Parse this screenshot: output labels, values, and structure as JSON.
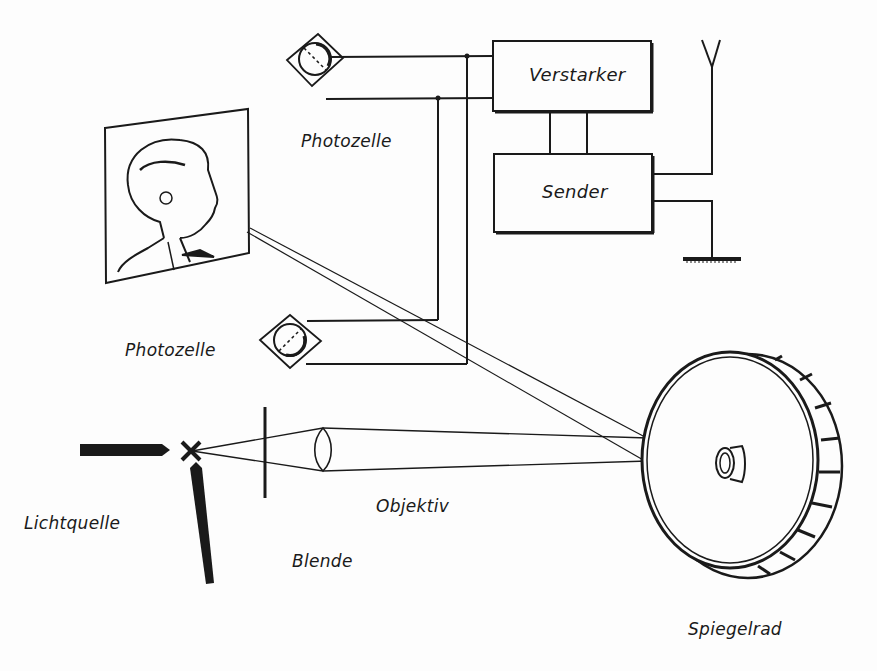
{
  "labels": {
    "amplifier": "Verstarker",
    "transmitter": "Sender",
    "photocell_top": "Photozelle",
    "photocell_bottom": "Photozelle",
    "light_source": "Lichtquelle",
    "objective": "Objektiv",
    "aperture": "Blende",
    "mirror_wheel": "Spiegelrad"
  },
  "colors": {
    "ink": "#1a1a1a",
    "paper": "#fdfdfd"
  }
}
